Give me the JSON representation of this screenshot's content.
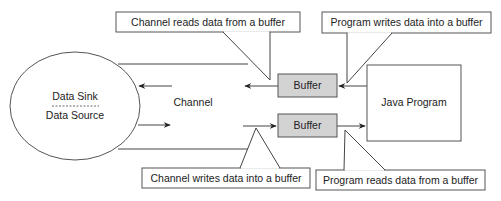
{
  "diagram": {
    "ellipse": {
      "top_label": "Data Sink",
      "bottom_label": "Data Source"
    },
    "channel_label": "Channel",
    "buffers": [
      {
        "label": "Buffer",
        "position": "top"
      },
      {
        "label": "Buffer",
        "position": "bottom"
      }
    ],
    "program_box": {
      "label": "Java Program"
    },
    "callouts": [
      {
        "id": "top-left",
        "text": "Channel reads data from a buffer"
      },
      {
        "id": "top-right",
        "text": "Program writes data into a buffer"
      },
      {
        "id": "bottom-left",
        "text": "Channel writes data into a buffer"
      },
      {
        "id": "bottom-right",
        "text": "Program reads data from a buffer"
      }
    ],
    "colors": {
      "buffer_fill": "#d3d3d3",
      "line": "#444444",
      "background": "#ffffff"
    }
  }
}
